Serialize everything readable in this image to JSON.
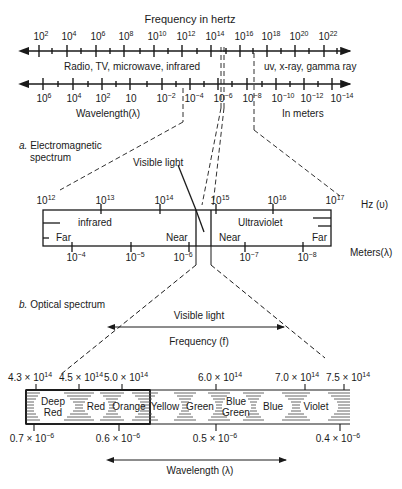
{
  "panel_a": {
    "caption_letter": "a.",
    "caption": "Electromagnetic",
    "caption_line2": "spectrum",
    "freq_axis_title": "Frequency in hertz",
    "freq_ticks": [
      {
        "base": "10",
        "exp": "2"
      },
      {
        "base": "10",
        "exp": "4"
      },
      {
        "base": "10",
        "exp": "6"
      },
      {
        "base": "10",
        "exp": "8"
      },
      {
        "base": "10",
        "exp": "10"
      },
      {
        "base": "10",
        "exp": "12"
      },
      {
        "base": "10",
        "exp": "14"
      },
      {
        "base": "10",
        "exp": "16"
      },
      {
        "base": "10",
        "exp": "18"
      },
      {
        "base": "10",
        "exp": "20"
      },
      {
        "base": "10",
        "exp": "22"
      }
    ],
    "region_low": "Radio, TV, microwave, infrared",
    "region_high": "uv, x-ray, gamma ray",
    "wave_ticks": [
      {
        "base": "10",
        "exp": "6"
      },
      {
        "base": "10",
        "exp": "4"
      },
      {
        "base": "10",
        "exp": "2"
      },
      {
        "base": "10",
        "exp": ""
      },
      {
        "base": "10",
        "exp": "−2"
      },
      {
        "base": "10",
        "exp": "−4"
      },
      {
        "base": "10",
        "exp": "−6"
      },
      {
        "base": "10",
        "exp": "−8"
      },
      {
        "base": "10",
        "exp": "−10"
      },
      {
        "base": "10",
        "exp": "−12"
      },
      {
        "base": "10",
        "exp": "−14"
      }
    ],
    "wave_axis_title": "Wavelength(λ)",
    "wave_units": "In meters"
  },
  "zoom_a": {
    "visible_light_label": "Visible light",
    "hz_ticks": [
      {
        "base": "10",
        "exp": "12"
      },
      {
        "base": "10",
        "exp": "13"
      },
      {
        "base": "10",
        "exp": "14"
      },
      {
        "base": "10",
        "exp": "15"
      },
      {
        "base": "10",
        "exp": "16"
      },
      {
        "base": "10",
        "exp": "17"
      }
    ],
    "hz_unit": "Hz (υ)",
    "infrared": "infrared",
    "ultraviolet": "Ultraviolet",
    "ir_far": "Far",
    "ir_near": "Near",
    "uv_near": "Near",
    "uv_far": "Far",
    "m_ticks": [
      {
        "base": "10",
        "exp": "−4"
      },
      {
        "base": "10",
        "exp": "−5"
      },
      {
        "base": "10",
        "exp": "−6"
      },
      {
        "base": "10",
        "exp": "−7"
      },
      {
        "base": "10",
        "exp": "−8"
      }
    ],
    "m_unit": "Meters(λ)"
  },
  "panel_b": {
    "caption_letter": "b.",
    "caption": "Optical spectrum",
    "visible_light_label": "Visible light",
    "frequency_label": "Frequency (f)",
    "freq_ticks": [
      "4.3 × 10",
      "4.5 × 10",
      "5.0 × 10",
      "6.0 × 10",
      "7.0 × 10",
      "7.5 × 10"
    ],
    "freq_exp": "14",
    "bands": [
      "Deep Red",
      "Red",
      "Orange",
      "Yellow",
      "Green",
      "Blue Green",
      "Blue",
      "Violet"
    ],
    "wave_ticks": [
      "0.7 × 10",
      "0.6 × 10",
      "0.5 × 10",
      "0.4 × 10"
    ],
    "wave_exp": "−6",
    "wavelength_label": "Wavelength (λ)"
  }
}
